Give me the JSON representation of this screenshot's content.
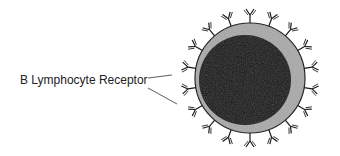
{
  "diagram": {
    "label": "B Lymphocyte Receptor",
    "colors": {
      "ink": "#1a1a1a",
      "membrane": "#9a9a9a",
      "background": "#ffffff"
    }
  }
}
